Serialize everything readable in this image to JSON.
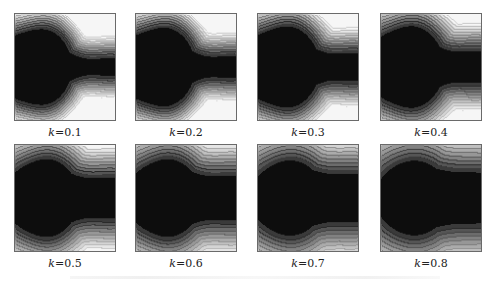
{
  "figure": {
    "panel_labels": [
      "k=0.1",
      "k=0.2",
      "k=0.3",
      "k=0.4",
      "k=0.5",
      "k=0.6",
      "k=0.7",
      "k=0.8"
    ],
    "k_symbol": "k",
    "k_values": [
      "0.1",
      "0.2",
      "0.3",
      "0.4",
      "0.5",
      "0.6",
      "0.7",
      "0.8"
    ]
  },
  "colors": {
    "levels": [
      "#0d0d0d",
      "#3a3a3a",
      "#555555",
      "#6c6c6c",
      "#818181",
      "#979797",
      "#ababab",
      "#c0c0c0",
      "#d4d4d4",
      "#e6e6e6",
      "#f6f6f6"
    ],
    "contour_line": "#3c3c3c",
    "border": "#6a6a6a"
  },
  "chart_data": {
    "type": "heatmap",
    "subtype": "filled-contour grid",
    "title": "",
    "layout": {
      "rows": 2,
      "cols": 4,
      "grid": false,
      "legend": "none"
    },
    "panels": [
      {
        "label": "k=0.1",
        "k": 0.1,
        "bulb_x": 0.18,
        "bulb_r": 0.36,
        "neck": 0.04,
        "spread": 1.0
      },
      {
        "label": "k=0.2",
        "k": 0.2,
        "bulb_x": 0.2,
        "bulb_r": 0.37,
        "neck": 0.06,
        "spread": 1.05
      },
      {
        "label": "k=0.3",
        "k": 0.3,
        "bulb_x": 0.22,
        "bulb_r": 0.38,
        "neck": 0.09,
        "spread": 1.15
      },
      {
        "label": "k=0.4",
        "k": 0.4,
        "bulb_x": 0.24,
        "bulb_r": 0.38,
        "neck": 0.11,
        "spread": 1.25
      },
      {
        "label": "k=0.5",
        "k": 0.5,
        "bulb_x": 0.27,
        "bulb_r": 0.36,
        "neck": 0.16,
        "spread": 1.45
      },
      {
        "label": "k=0.6",
        "k": 0.6,
        "bulb_x": 0.28,
        "bulb_r": 0.36,
        "neck": 0.18,
        "spread": 1.55
      },
      {
        "label": "k=0.7",
        "k": 0.7,
        "bulb_x": 0.3,
        "bulb_r": 0.35,
        "neck": 0.2,
        "spread": 1.7
      },
      {
        "label": "k=0.8",
        "k": 0.8,
        "bulb_x": 0.32,
        "bulb_r": 0.35,
        "neck": 0.22,
        "spread": 1.8
      }
    ],
    "xlabel": "",
    "ylabel": "",
    "levels": 11
  }
}
